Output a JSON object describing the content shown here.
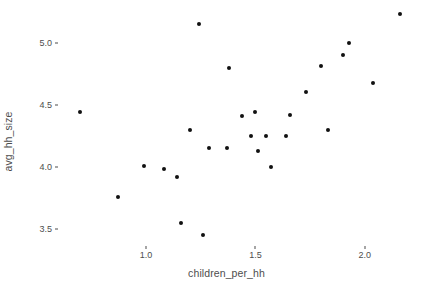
{
  "chart_data": {
    "type": "scatter",
    "title": "",
    "xlabel": "children_per_hh",
    "ylabel": "avg_hh_size",
    "xlim": [
      0.62,
      2.23
    ],
    "ylim": [
      3.38,
      5.28
    ],
    "xticks": [
      1.0,
      1.5,
      2.0
    ],
    "xticklabels": [
      "1.0",
      "1.5",
      "2.0"
    ],
    "yticks": [
      3.5,
      4.0,
      4.5,
      5.0
    ],
    "yticklabels": [
      "3.5",
      "4.0",
      "4.5",
      "5.0"
    ],
    "grid": false,
    "legend": null,
    "point_color": "#111111",
    "point_size": 4,
    "background": "#ffffff",
    "axis_text_color": "#4d4d4d",
    "n_points": 27,
    "x": [
      0.7,
      0.87,
      0.99,
      1.08,
      1.14,
      1.16,
      1.2,
      1.24,
      1.26,
      1.29,
      1.37,
      1.38,
      1.44,
      1.48,
      1.5,
      1.51,
      1.55,
      1.57,
      1.64,
      1.66,
      1.73,
      1.8,
      1.83,
      1.9,
      1.93,
      2.04,
      2.16
    ],
    "y": [
      4.44,
      3.76,
      4.01,
      3.98,
      3.92,
      3.55,
      4.3,
      5.15,
      3.45,
      4.15,
      4.15,
      4.8,
      4.41,
      4.25,
      4.44,
      4.13,
      4.25,
      4.0,
      4.25,
      4.42,
      4.6,
      4.81,
      4.3,
      4.9,
      5.0,
      4.68,
      5.23
    ],
    "series": [
      {
        "name": "observations",
        "points": [
          {
            "x": 0.7,
            "y": 4.44
          },
          {
            "x": 0.87,
            "y": 3.76
          },
          {
            "x": 0.99,
            "y": 4.01
          },
          {
            "x": 1.08,
            "y": 3.98
          },
          {
            "x": 1.14,
            "y": 3.92
          },
          {
            "x": 1.16,
            "y": 3.55
          },
          {
            "x": 1.2,
            "y": 4.3
          },
          {
            "x": 1.24,
            "y": 5.15
          },
          {
            "x": 1.26,
            "y": 3.45
          },
          {
            "x": 1.29,
            "y": 4.15
          },
          {
            "x": 1.37,
            "y": 4.15
          },
          {
            "x": 1.38,
            "y": 4.8
          },
          {
            "x": 1.44,
            "y": 4.41
          },
          {
            "x": 1.48,
            "y": 4.25
          },
          {
            "x": 1.5,
            "y": 4.44
          },
          {
            "x": 1.51,
            "y": 4.13
          },
          {
            "x": 1.55,
            "y": 4.25
          },
          {
            "x": 1.57,
            "y": 4.0
          },
          {
            "x": 1.64,
            "y": 4.25
          },
          {
            "x": 1.66,
            "y": 4.42
          },
          {
            "x": 1.73,
            "y": 4.6
          },
          {
            "x": 1.8,
            "y": 4.81
          },
          {
            "x": 1.83,
            "y": 4.3
          },
          {
            "x": 1.9,
            "y": 4.9
          },
          {
            "x": 1.93,
            "y": 5.0
          },
          {
            "x": 2.04,
            "y": 4.68
          },
          {
            "x": 2.16,
            "y": 5.23
          }
        ]
      }
    ]
  },
  "panel": {
    "left": 63,
    "top": 8,
    "width": 352,
    "height": 236
  }
}
